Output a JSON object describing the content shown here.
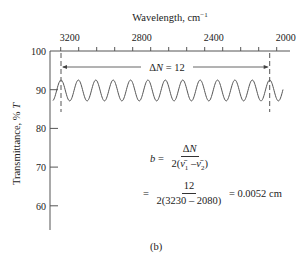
{
  "chart_data": {
    "type": "line",
    "title": "",
    "top_axis_label": "Wavelength, cm⁻¹",
    "xlabel": "Wavelength, cm⁻¹",
    "ylabel": "Transmittance, % T",
    "x_ticks": [
      3200,
      2800,
      2400,
      2000
    ],
    "x_tick_labels": [
      "3200",
      "2800",
      "2400",
      "2000"
    ],
    "x_minor_step": 100,
    "xlim": [
      3250,
      1950
    ],
    "y_ticks": [
      60,
      70,
      80,
      90,
      100
    ],
    "y_tick_labels": [
      "60",
      "70",
      "80",
      "90",
      "100"
    ],
    "ylim": [
      54,
      100
    ],
    "grid": false,
    "series": [
      {
        "name": "Interference fringes",
        "description": "Sinusoidal transmittance oscillation between ~87% and ~92.5% T",
        "x_start": 3255,
        "x_end": 2045,
        "y_center": 89.8,
        "amplitude": 2.7,
        "peaks_cm": [
          3230,
          3134,
          3038,
          2942,
          2846,
          2750,
          2655,
          2559,
          2463,
          2367,
          2271,
          2176,
          2080
        ]
      }
    ],
    "annotations": {
      "delta_n_label": "ΔN = 12",
      "nu1": 3230,
      "nu2": 2080,
      "fringe_count": 12
    }
  },
  "axis": {
    "top_label": "Wavelength, cm",
    "top_label_sup": "−1",
    "left_label": "Transmittance, % ",
    "left_label_italic": "T",
    "x_tick_labels": [
      "3200",
      "2800",
      "2400",
      "2000"
    ],
    "y_tick_labels": [
      "100",
      "90",
      "80",
      "70",
      "60"
    ]
  },
  "annotation": {
    "delta": "Δ",
    "n": "N",
    "equals": " = 12"
  },
  "equation": {
    "b": "b",
    "eq1": " = ",
    "num1_delta": "Δ",
    "num1_n": "N",
    "den1_pre": "2(",
    "nu1": "ν̄",
    "sub1": "1",
    "minus": " –",
    "nu2": "ν̄",
    "sub2": "2",
    "den1_post": ")",
    "eq2": "= ",
    "num2": "12",
    "den2": "2(3230 – 2080)",
    "result": " = 0.0052 cm"
  },
  "caption": "(b)",
  "colors": {
    "line": "#555555",
    "text": "#222222",
    "background": "#ffffff"
  }
}
